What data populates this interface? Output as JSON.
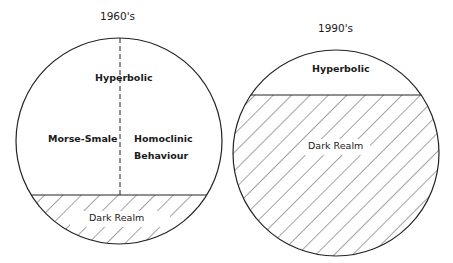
{
  "diagram": {
    "left": {
      "title": "1960's",
      "regions": {
        "top": "Hyperbolic",
        "left": "Morse-Smale",
        "right_line1": "Homoclinic",
        "right_line2": "Behaviour",
        "bottom": "Dark Realm"
      }
    },
    "right": {
      "title": "1990's",
      "regions": {
        "top": "Hyperbolic",
        "bottom": "Dark Realm"
      }
    }
  }
}
